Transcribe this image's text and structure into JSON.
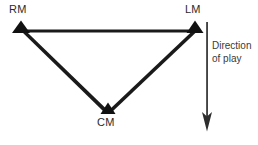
{
  "diagram": {
    "background_color": "#ffffff",
    "ink_color": "#1a1a1a",
    "nodes": [
      {
        "id": "rm",
        "label": "RM",
        "marker": "triangle-up-filled",
        "x": 21,
        "y": 27
      },
      {
        "id": "lm",
        "label": "LM",
        "marker": "triangle-up-filled",
        "x": 195,
        "y": 27
      },
      {
        "id": "cm",
        "label": "CM",
        "marker": "triangle-up-filled",
        "x": 108,
        "y": 109
      }
    ],
    "connections": [
      {
        "from": "rm",
        "to": "lm",
        "style": "solid"
      },
      {
        "from": "rm",
        "to": "cm",
        "style": "solid"
      },
      {
        "from": "lm",
        "to": "cm",
        "style": "solid"
      }
    ],
    "direction_arrow": {
      "caption": "Direction\nof play",
      "orientation": "down",
      "x": 207,
      "y_start": 22,
      "y_end": 131,
      "color": "#2e2e2e"
    }
  }
}
